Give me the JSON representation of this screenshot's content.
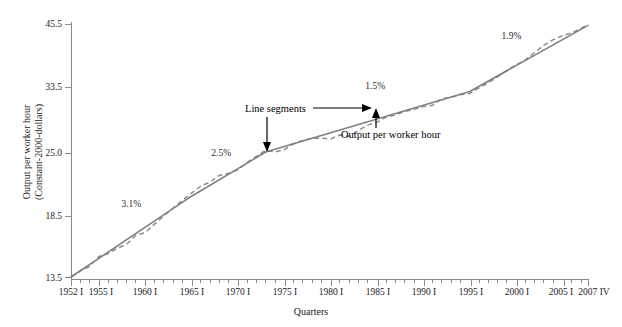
{
  "figure": {
    "background": "#ffffff",
    "fit_line_color": "#808080",
    "actual_line_color": "#8d8d8d",
    "annotation_color": "#000000"
  },
  "chart_data": {
    "type": "line",
    "title": "",
    "subtitle": "",
    "xlabel": "Quarters",
    "ylabel": "Output per worker hour (Constant-2000-dollars)",
    "ylabel_line1": "Output per worker hour",
    "ylabel_line2": "(Constant-2000-dollars)",
    "grid": false,
    "legend": "none",
    "yscale": "log",
    "ylim": [
      13.5,
      45.5
    ],
    "ytick_labels": [
      "45.5",
      "33.5",
      "25.0",
      "18.5",
      "13.5"
    ],
    "ytick_values": [
      45.5,
      33.5,
      25.0,
      18.5,
      13.5
    ],
    "xlim": [
      "1952 I",
      "2007 IV"
    ],
    "xtick_labels": [
      "1952 I",
      "1955 I",
      "1960 I",
      "1965 I",
      "1970 I",
      "1975 I",
      "1980 I",
      "1985 I",
      "1990 I",
      "1995 I",
      "2000 I",
      "2005 I",
      "2007 IV"
    ],
    "xtick_years": [
      1952,
      1955,
      1960,
      1965,
      1970,
      1975,
      1980,
      1985,
      1990,
      1995,
      2000,
      2005,
      2007.75
    ],
    "minor_tick_interval_years": 1,
    "series": [
      {
        "name": "Line segments",
        "style": "solid",
        "color": "#808080",
        "x": [
          1952.0,
          1965.0,
          1973.0,
          1995.0,
          2007.75
        ],
        "y": [
          13.5,
          19.9,
          24.6,
          32.9,
          45.2
        ]
      },
      {
        "name": "Output per worker hour",
        "style": "dashed",
        "color": "#8d8d8d",
        "x": [
          1952.0,
          1953.0,
          1954.0,
          1955.0,
          1956.0,
          1957.0,
          1958.0,
          1959.0,
          1960.0,
          1961.0,
          1962.0,
          1963.0,
          1964.0,
          1965.0,
          1966.0,
          1967.0,
          1968.0,
          1969.0,
          1970.0,
          1971.0,
          1972.0,
          1973.0,
          1974.0,
          1975.0,
          1976.0,
          1977.0,
          1978.0,
          1979.0,
          1980.0,
          1981.0,
          1982.0,
          1983.0,
          1984.0,
          1985.0,
          1986.0,
          1987.0,
          1988.0,
          1989.0,
          1990.0,
          1991.0,
          1992.0,
          1993.0,
          1994.0,
          1995.0,
          1996.0,
          1997.0,
          1998.0,
          1999.0,
          2000.0,
          2001.0,
          2002.0,
          2003.0,
          2004.0,
          2005.0,
          2006.0,
          2007.0,
          2007.75
        ],
        "y": [
          13.5,
          13.9,
          14.2,
          14.9,
          15.1,
          15.5,
          15.8,
          16.5,
          16.7,
          17.4,
          18.1,
          18.8,
          19.5,
          20.2,
          20.9,
          21.3,
          22.0,
          22.2,
          22.6,
          23.4,
          24.1,
          24.8,
          24.6,
          24.9,
          25.6,
          26.0,
          26.3,
          26.3,
          26.2,
          26.7,
          26.5,
          27.3,
          28.0,
          28.4,
          29.1,
          29.4,
          29.9,
          30.2,
          30.6,
          30.8,
          31.8,
          32.0,
          32.4,
          32.6,
          33.5,
          34.3,
          35.3,
          36.4,
          37.4,
          38.3,
          39.7,
          41.1,
          42.2,
          43.0,
          43.6,
          44.6,
          45.3
        ]
      }
    ],
    "annotations": [
      {
        "id": "rate-1",
        "text": "3.1%",
        "x": 1958.5,
        "y": 18.9,
        "kind": "growth-rate"
      },
      {
        "id": "rate-2",
        "text": "2.5%",
        "x": 1968.2,
        "y": 24.1,
        "kind": "growth-rate"
      },
      {
        "id": "rate-3",
        "text": "1.5%",
        "x": 1984.8,
        "y": 33.3,
        "kind": "growth-rate"
      },
      {
        "id": "rate-4",
        "text": "1.9%",
        "x": 1999.5,
        "y": 42.4,
        "kind": "growth-rate"
      },
      {
        "id": "callout-1",
        "text": "Line segments",
        "kind": "callout-with-arrows"
      },
      {
        "id": "callout-2",
        "text": "Output per worker hour",
        "kind": "callout-with-arrow"
      }
    ]
  },
  "labels": {
    "y_axis_title_line1": "Output per worker hour",
    "y_axis_title_line2": "(Constant-2000-dollars)",
    "x_axis_title": "Quarters",
    "y_45_5": "45.5",
    "y_33_5": "33.5",
    "y_25_0": "25.0",
    "y_18_5": "18.5",
    "y_13_5": "13.5",
    "x_1952": "1952 I",
    "x_1955": "1955 I",
    "x_1960": "1960 I",
    "x_1965": "1965 I",
    "x_1970": "1970 I",
    "x_1975": "1975 I",
    "x_1980": "1980 I",
    "x_1985": "1985 I",
    "x_1990": "1990 I",
    "x_1995": "1995 I",
    "x_2000": "2000 I",
    "x_2005": "2005 I",
    "x_2007": "2007 IV",
    "rate_3_1": "3.1%",
    "rate_2_5": "2.5%",
    "rate_1_5": "1.5%",
    "rate_1_9": "1.9%",
    "callout_line_segments": "Line segments",
    "callout_output_per_worker_hour": "Output per worker hour"
  }
}
